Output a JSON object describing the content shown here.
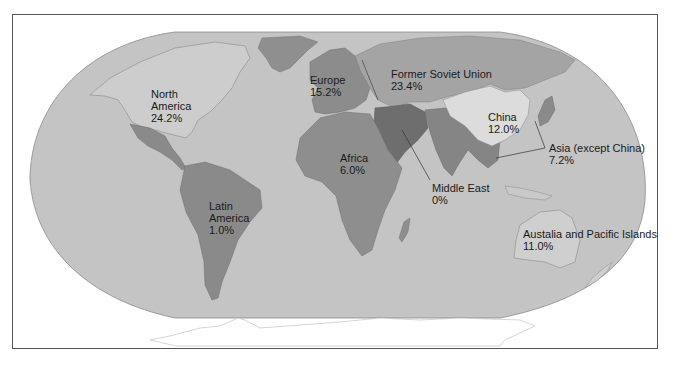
{
  "map": {
    "title": "",
    "colors": {
      "ocean": "#c4c4c4",
      "north_america": "#cdcdcd",
      "latin_america": "#8a8a8a",
      "greenland": "#8f8f8f",
      "europe": "#8c8c8c",
      "former_soviet_union": "#a4a4a4",
      "middle_east": "#6e6e6e",
      "south_asia": "#858585",
      "china": "#dcdcdc",
      "africa": "#8e8e8e",
      "australia": "#cfcfcf",
      "antarctica": "#ffffff",
      "frame": "#555555"
    },
    "regions": [
      {
        "id": "north-america",
        "name_lines": [
          "North",
          "America"
        ],
        "value": "24.2%"
      },
      {
        "id": "europe",
        "name_lines": [
          "Europe"
        ],
        "value": "15.2%"
      },
      {
        "id": "former-soviet-union",
        "name_lines": [
          "Former Soviet Union"
        ],
        "value": "23.4%"
      },
      {
        "id": "china",
        "name_lines": [
          "China"
        ],
        "value": "12.0%"
      },
      {
        "id": "asia-except-china",
        "name_lines": [
          "Asia (except China)"
        ],
        "value": "7.2%"
      },
      {
        "id": "africa",
        "name_lines": [
          "Africa"
        ],
        "value": "6.0%"
      },
      {
        "id": "middle-east",
        "name_lines": [
          "Middle East"
        ],
        "value": "0%"
      },
      {
        "id": "latin-america",
        "name_lines": [
          "Latin",
          "America"
        ],
        "value": "1.0%"
      },
      {
        "id": "australia-pacific",
        "name_lines": [
          "Austalia and Pacific Islands"
        ],
        "value": "11.0%"
      }
    ]
  }
}
